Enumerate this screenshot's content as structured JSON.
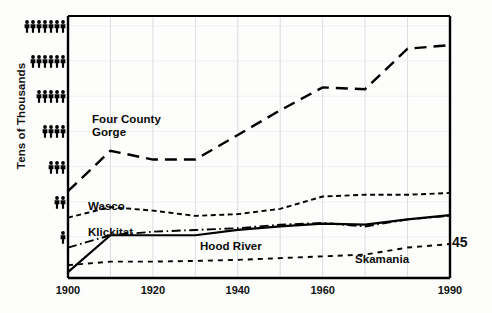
{
  "page": {
    "number": "45"
  },
  "axes": {
    "ylabel": "Tens of Thousands",
    "y_tick_unit_icon": "person-pictogram",
    "y_ticks": [
      {
        "value": 7,
        "icons": 7
      },
      {
        "value": 6,
        "icons": 6
      },
      {
        "value": 5,
        "icons": 5
      },
      {
        "value": 4,
        "icons": 4
      },
      {
        "value": 3,
        "icons": 3
      },
      {
        "value": 2,
        "icons": 2
      },
      {
        "value": 1,
        "icons": 1
      }
    ],
    "x_tick_labels": [
      "1900",
      "1920",
      "1940",
      "1960",
      "1990"
    ],
    "x_gridline_years": [
      1900,
      1910,
      1920,
      1930,
      1940,
      1950,
      1960,
      1970,
      1980,
      1990
    ]
  },
  "series_labels": {
    "four_county_gorge": "Four County\nGorge",
    "wasco": "Wasco",
    "klickitat": "Klickitat",
    "hood_river": "Hood River",
    "skamania": "Skamania"
  },
  "chart_data": {
    "type": "line",
    "title": "",
    "xlabel": "",
    "ylabel": "Tens of Thousands",
    "xlim": [
      1900,
      1990
    ],
    "ylim": [
      0,
      7.5
    ],
    "grid": true,
    "legend": "inline-labels",
    "x": [
      1900,
      1910,
      1920,
      1930,
      1940,
      1950,
      1960,
      1970,
      1980,
      1990
    ],
    "series": [
      {
        "name": "Four County Gorge",
        "style": "long-dash",
        "color": "#000000",
        "values": [
          2.3,
          3.45,
          3.2,
          3.2,
          3.9,
          4.6,
          5.25,
          5.2,
          6.35,
          6.45
        ]
      },
      {
        "name": "Wasco",
        "style": "short-dash",
        "color": "#000000",
        "values": [
          1.55,
          1.85,
          1.75,
          1.6,
          1.65,
          1.8,
          2.15,
          2.2,
          2.2,
          2.25
        ]
      },
      {
        "name": "Klickitat",
        "style": "dash-dot",
        "color": "#000000",
        "values": [
          0.7,
          1.05,
          1.15,
          1.2,
          1.25,
          1.35,
          1.4,
          1.3,
          1.5,
          1.6
        ]
      },
      {
        "name": "Hood River",
        "style": "solid",
        "color": "#000000",
        "values": [
          0.0,
          1.05,
          1.05,
          1.05,
          1.2,
          1.3,
          1.38,
          1.35,
          1.5,
          1.62
        ]
      },
      {
        "name": "Skamania",
        "style": "fine-dash",
        "color": "#000000",
        "values": [
          0.2,
          0.3,
          0.3,
          0.32,
          0.35,
          0.4,
          0.45,
          0.5,
          0.7,
          0.8
        ]
      }
    ]
  }
}
